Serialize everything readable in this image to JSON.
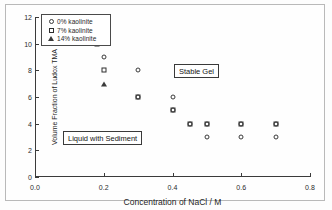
{
  "chart_data": {
    "type": "scatter",
    "title": "",
    "xlabel": "Concentration of NaCl / M",
    "ylabel": "Volume Fraction of Ludox TMA",
    "xlim": [
      0.0,
      0.8
    ],
    "ylim": [
      0,
      12
    ],
    "xticks": [
      "0.0",
      "0.2",
      "0.4",
      "0.6",
      "0.8"
    ],
    "xtick_values": [
      0.0,
      0.2,
      0.4,
      0.6,
      0.8
    ],
    "yticks": [
      "0",
      "2",
      "4",
      "6",
      "8",
      "10",
      "12"
    ],
    "ytick_values": [
      0,
      2,
      4,
      6,
      8,
      10,
      12
    ],
    "grid": false,
    "legend_position": "upper-left",
    "series": [
      {
        "name": "0% kaolinite",
        "marker": "circle",
        "points": [
          {
            "x": 0.2,
            "y": 9
          },
          {
            "x": 0.3,
            "y": 8
          },
          {
            "x": 0.3,
            "y": 6
          },
          {
            "x": 0.4,
            "y": 6
          },
          {
            "x": 0.4,
            "y": 5
          },
          {
            "x": 0.45,
            "y": 4
          },
          {
            "x": 0.5,
            "y": 4
          },
          {
            "x": 0.5,
            "y": 3
          },
          {
            "x": 0.6,
            "y": 4
          },
          {
            "x": 0.6,
            "y": 3
          },
          {
            "x": 0.7,
            "y": 4
          },
          {
            "x": 0.7,
            "y": 3
          }
        ]
      },
      {
        "name": "7% kaolinite",
        "marker": "square",
        "points": [
          {
            "x": 0.18,
            "y": 10
          },
          {
            "x": 0.2,
            "y": 8
          },
          {
            "x": 0.3,
            "y": 6
          },
          {
            "x": 0.4,
            "y": 5
          },
          {
            "x": 0.45,
            "y": 4
          },
          {
            "x": 0.5,
            "y": 4
          },
          {
            "x": 0.6,
            "y": 4
          },
          {
            "x": 0.7,
            "y": 4
          }
        ]
      },
      {
        "name": "14% kaolinite",
        "marker": "triangle",
        "points": [
          {
            "x": 0.2,
            "y": 7
          }
        ]
      }
    ],
    "annotations": [
      {
        "text": "Stable Gel",
        "x": 0.5,
        "y": 8.3
      },
      {
        "text": "Liquid with Sediment",
        "x": 0.19,
        "y": 3.4
      }
    ]
  },
  "legend": {
    "items": [
      {
        "label": "0% kaolinite",
        "marker": "circle"
      },
      {
        "label": "7% kaolinite",
        "marker": "square"
      },
      {
        "label": "14% kaolinite",
        "marker": "triangle"
      }
    ]
  }
}
